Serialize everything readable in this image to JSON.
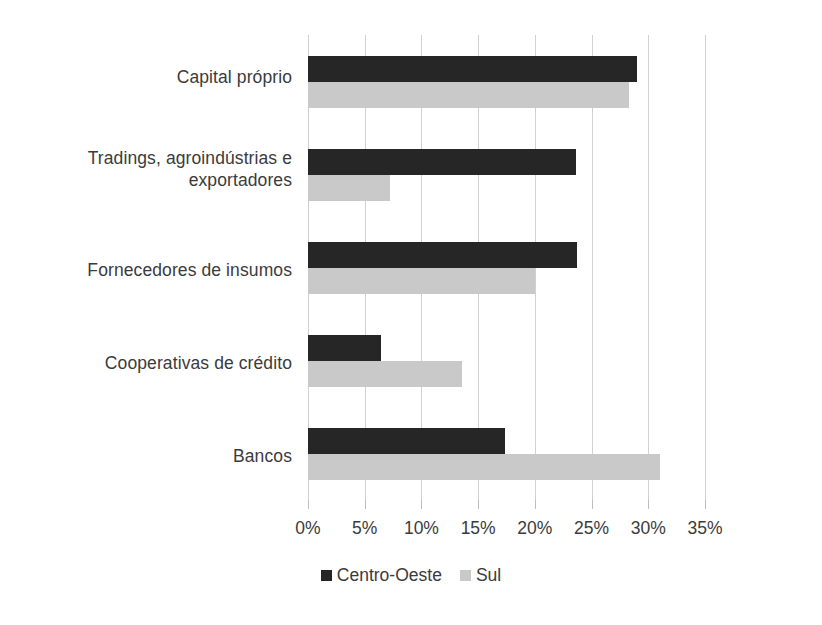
{
  "chart_data": {
    "type": "bar",
    "orientation": "horizontal",
    "title": "",
    "subtitle": "",
    "xlabel": "",
    "ylabel": "",
    "categories": [
      "Capital próprio",
      "Tradings, agroindústrias e exportadores",
      "Fornecedores de insumos",
      "Cooperativas de crédito",
      "Bancos"
    ],
    "series": [
      {
        "name": "Centro-Oeste",
        "color": "#262626",
        "values": [
          29.0,
          23.6,
          23.7,
          6.4,
          17.4
        ]
      },
      {
        "name": "Sul",
        "color": "#c9c9c9",
        "values": [
          28.3,
          7.2,
          20.0,
          13.6,
          31.0
        ]
      }
    ],
    "xlim": [
      0,
      35
    ],
    "xticks": [
      0,
      5,
      10,
      15,
      20,
      25,
      30,
      35
    ],
    "xtick_labels": [
      "0%",
      "5%",
      "10%",
      "15%",
      "20%",
      "25%",
      "30%",
      "35%"
    ],
    "grid": true,
    "grid_axis": "x",
    "legend_position": "bottom",
    "value_format": "percent"
  },
  "legend": {
    "items": [
      {
        "label": "Centro-Oeste",
        "color": "#262626"
      },
      {
        "label": "Sul",
        "color": "#c9c9c9"
      }
    ]
  },
  "colors": {
    "background": "#ffffff",
    "text": "#3b3b3b",
    "gridline": "#d0d0d0",
    "axis": "#bdbdbd",
    "series_centro_oeste": "#262626",
    "series_sul": "#c9c9c9"
  }
}
